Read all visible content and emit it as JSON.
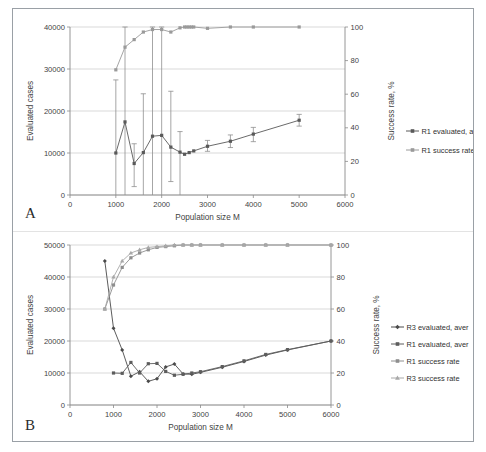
{
  "figure": {
    "panel_a_label": "A",
    "panel_b_label": "B"
  },
  "chart_data": [
    {
      "id": "panel-a",
      "type": "line",
      "title": "",
      "panel_label": "A",
      "xlabel": "Population size M",
      "ylabel": "Evaluated cases",
      "y2label": "Success rate, %",
      "xlim": [
        0,
        6000
      ],
      "ylim": [
        0,
        40000
      ],
      "y2lim": [
        0,
        100
      ],
      "xticks": [
        0,
        1000,
        2000,
        3000,
        4000,
        5000,
        6000
      ],
      "xticklabels": [
        "0",
        "1000",
        "2000",
        "3000",
        "4000",
        "5000",
        "6000"
      ],
      "yticks": [
        0,
        10000,
        20000,
        30000,
        40000
      ],
      "yticklabels": [
        "0",
        "10000",
        "20000",
        "30000",
        "40000"
      ],
      "y2ticks": [
        0,
        20,
        40,
        60,
        80,
        100
      ],
      "y2ticklabels": [
        "0",
        "20",
        "40",
        "60",
        "80",
        "100"
      ],
      "grid": true,
      "legend_position": "right",
      "series": [
        {
          "name": "R1 evaluated, aver.",
          "axis": "left",
          "marker": "square",
          "color": "#595959",
          "x": [
            1000,
            1200,
            1400,
            1600,
            1800,
            2000,
            2200,
            2400,
            2500,
            2600,
            2700,
            3000,
            3500,
            4000,
            5000
          ],
          "values": [
            10000,
            17400,
            7500,
            10100,
            14000,
            14200,
            11400,
            10200,
            9700,
            10100,
            10500,
            11600,
            12800,
            14500,
            17800
          ],
          "err_low": [
            0,
            0,
            2000,
            0,
            0,
            0,
            3200,
            0,
            0,
            0,
            0,
            10400,
            11300,
            12700,
            16400
          ],
          "err_high": [
            27400,
            40000,
            12200,
            24100,
            40000,
            40000,
            24700,
            15100,
            0,
            0,
            0,
            13000,
            14300,
            16100,
            19200
          ]
        },
        {
          "name": "R1 success rate, %",
          "axis": "right",
          "marker": "square",
          "color": "#9a9a9a",
          "x": [
            1000,
            1200,
            1400,
            1600,
            1800,
            2000,
            2200,
            2400,
            2500,
            2550,
            2600,
            2650,
            2700,
            3000,
            3500,
            4000,
            5000
          ],
          "values": [
            74.5,
            88.0,
            92.5,
            97.0,
            98.5,
            98.5,
            97.0,
            99.5,
            100,
            100,
            100,
            100,
            100,
            99.2,
            100,
            100,
            100
          ]
        }
      ]
    },
    {
      "id": "panel-b",
      "type": "line",
      "title": "",
      "panel_label": "B",
      "xlabel": "Population size M",
      "ylabel": "Evaluated cases",
      "y2label": "Success rate, %",
      "xlim": [
        0,
        6000
      ],
      "ylim": [
        0,
        50000
      ],
      "y2lim": [
        0,
        100
      ],
      "xticks": [
        0,
        1000,
        2000,
        3000,
        4000,
        5000,
        6000
      ],
      "xticklabels": [
        "0",
        "1000",
        "2000",
        "3000",
        "4000",
        "5000",
        "6000"
      ],
      "yticks": [
        0,
        10000,
        20000,
        30000,
        40000,
        50000
      ],
      "yticklabels": [
        "0",
        "10000",
        "20000",
        "30000",
        "40000",
        "50000"
      ],
      "y2ticks": [
        0,
        20,
        40,
        60,
        80,
        100
      ],
      "y2ticklabels": [
        "0",
        "20",
        "40",
        "60",
        "80",
        "100"
      ],
      "grid": true,
      "legend_position": "right",
      "series": [
        {
          "name": "R3 evaluated, aver",
          "axis": "left",
          "marker": "diamond",
          "color": "#4a4a4a",
          "x": [
            800,
            1000,
            1200,
            1400,
            1600,
            1800,
            2000,
            2200,
            2400,
            2600,
            2800,
            3000,
            3500,
            4000,
            4500,
            5000,
            6000
          ],
          "values": [
            45000,
            24000,
            17200,
            9000,
            10400,
            7400,
            8200,
            11900,
            12800,
            9700,
            9600,
            10200,
            11800,
            13600,
            15600,
            17200,
            20000
          ]
        },
        {
          "name": "R1 evaluated, aver",
          "axis": "left",
          "marker": "square",
          "color": "#5d5d5d",
          "x": [
            1000,
            1200,
            1400,
            1600,
            1800,
            2000,
            2200,
            2400,
            2600,
            2800,
            3000,
            3500,
            4000,
            4500,
            5000,
            6000
          ],
          "values": [
            10000,
            9900,
            13300,
            10000,
            12900,
            13000,
            10500,
            9300,
            9600,
            10000,
            10400,
            12000,
            13800,
            15800,
            17300,
            20000
          ]
        },
        {
          "name": "R1 success rate",
          "axis": "right",
          "marker": "square",
          "color": "#8e8e8e",
          "x": [
            800,
            1000,
            1200,
            1400,
            1600,
            1800,
            2000,
            2200,
            2400,
            2600,
            2800,
            3000,
            3500,
            4000,
            4500,
            5000,
            6000
          ],
          "values": [
            60,
            75,
            86,
            92,
            95,
            97,
            98.5,
            99,
            99.5,
            100,
            100,
            100,
            100,
            100,
            100,
            100,
            100
          ]
        },
        {
          "name": "R3 success rate",
          "axis": "right",
          "marker": "triangle",
          "color": "#a8a8a8",
          "x": [
            800,
            1000,
            1200,
            1400,
            1600,
            1800,
            2000,
            2200,
            2400,
            2600,
            2800,
            3000,
            3500,
            4000,
            4500,
            5000,
            6000
          ],
          "values": [
            60,
            80,
            90,
            95,
            97,
            98.5,
            99,
            99.5,
            100,
            100,
            100,
            100,
            100,
            100,
            100,
            100,
            100
          ]
        }
      ]
    }
  ]
}
